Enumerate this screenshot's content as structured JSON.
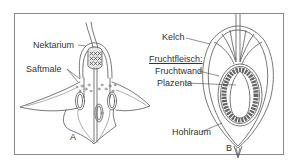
{
  "figure": {
    "panels": [
      {
        "id": "A",
        "subject": "flower-cross-section"
      },
      {
        "id": "B",
        "subject": "fruit-cross-section"
      }
    ],
    "labels": {
      "nektarium": "Nektarium",
      "saftmale": "Saftmale",
      "kelch": "Kelch",
      "fruchtfleisch": "Fruchtfleisch:",
      "fruchtwand": "Fruchtwand",
      "plazenta": "Plazenta",
      "hohlraum": "Hohlraum",
      "panel_a": "A",
      "panel_b": "B"
    },
    "colors": {
      "line": "#555555",
      "frame": "#8a8a8a",
      "seed_fill": "#777777",
      "background": "#ffffff"
    }
  }
}
